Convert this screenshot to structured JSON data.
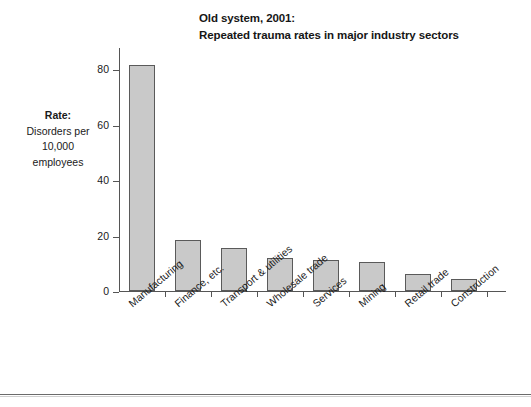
{
  "title": {
    "line1": "Old system, 2001:",
    "line2": "Repeated trauma rates in major industry sectors"
  },
  "axis_caption": {
    "head": "Rate:",
    "line1": "Disorders per",
    "line2": "10,000",
    "line3": "employees"
  },
  "colors": {
    "bar_fill": "#c9c9c9",
    "bar_border": "#5a5a5a",
    "axis": "#555555",
    "text": "#1a1a1a",
    "rule": "#6b6b6b"
  },
  "chart_data": {
    "type": "bar",
    "title": "Old system, 2001: Repeated trauma rates in major industry sectors",
    "subtitle": "",
    "xlabel": "",
    "ylabel": "Rate: Disorders per 10,000 employees",
    "ylim": [
      0,
      88
    ],
    "yticks": [
      0,
      20,
      40,
      60,
      80
    ],
    "ytick_labels": [
      "0",
      "20",
      "40",
      "60",
      "80"
    ],
    "grid": false,
    "legend": false,
    "categories": [
      "Manufacturing",
      "Finance, etc.",
      "Transport & utilities",
      "Wholesale trade",
      "Services",
      "Mining",
      "Retail trade",
      "Construction"
    ],
    "values": [
      81.5,
      18.5,
      15.5,
      11.8,
      11.2,
      10.5,
      6.0,
      4.3
    ]
  }
}
